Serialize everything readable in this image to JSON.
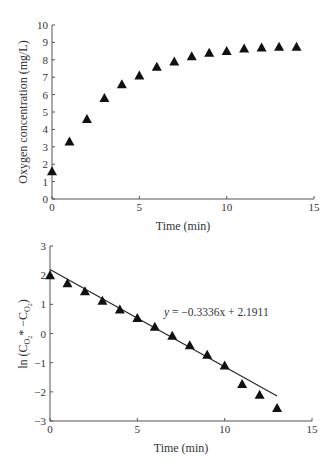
{
  "chart_data": [
    {
      "type": "scatter",
      "title": "",
      "xlabel": "Time (min)",
      "ylabel": "Oxygen concentration (mg/L)",
      "xlim": [
        0,
        15
      ],
      "ylim": [
        0,
        10
      ],
      "xticks": [
        0,
        5,
        10,
        15
      ],
      "yticks": [
        0,
        1,
        2,
        3,
        4,
        5,
        6,
        7,
        8,
        9,
        10
      ],
      "grid": false,
      "marker": "filled-triangle",
      "series": [
        {
          "name": "Oxygen concentration",
          "x": [
            0,
            1,
            2,
            3,
            4,
            5,
            6,
            7,
            8,
            9,
            10,
            11,
            12,
            13,
            14
          ],
          "y": [
            1.6,
            3.3,
            4.6,
            5.8,
            6.6,
            7.1,
            7.6,
            7.9,
            8.2,
            8.4,
            8.5,
            8.65,
            8.7,
            8.75,
            8.75
          ]
        }
      ]
    },
    {
      "type": "scatter",
      "title": "",
      "xlabel": "Time (min)",
      "ylabel": "ln (C_O2* − C_O2)",
      "xlim": [
        0,
        15
      ],
      "ylim": [
        -3,
        3
      ],
      "xticks": [
        0,
        5,
        10,
        15
      ],
      "yticks": [
        -3,
        -2,
        -1,
        0,
        1,
        2,
        3
      ],
      "grid": false,
      "marker": "filled-triangle",
      "series": [
        {
          "name": "ln(C*-C)",
          "x": [
            0,
            1,
            2,
            3,
            4,
            5,
            6,
            7,
            8,
            9,
            10,
            11,
            12,
            13
          ],
          "y": [
            2.0,
            1.72,
            1.45,
            1.12,
            0.82,
            0.53,
            0.23,
            -0.08,
            -0.4,
            -0.73,
            -1.1,
            -1.73,
            -2.1,
            -2.55
          ]
        }
      ],
      "trendline": {
        "slope": -0.3336,
        "intercept": 2.1911,
        "x_range": [
          0,
          13
        ],
        "equation_label": "y = −0.3336x + 2.1911"
      }
    }
  ],
  "labels": {
    "top": {
      "xlabel": "Time (min)",
      "ylabel": "Oxygen concentration (mg/L)",
      "xticks": [
        "0",
        "5",
        "10",
        "15"
      ],
      "yticks": [
        "0",
        "1",
        "2",
        "3",
        "4",
        "5",
        "6",
        "7",
        "8",
        "9",
        "10"
      ]
    },
    "bottom": {
      "xlabel": "Time (min)",
      "ylabel_prefix": "ln (C",
      "ylabel_sub1": "O",
      "ylabel_subsub1": "2",
      "ylabel_mid": "* −C",
      "ylabel_sub2": "O",
      "ylabel_subsub2": "2",
      "ylabel_suffix": ")",
      "xticks": [
        "0",
        "5",
        "10",
        "15"
      ],
      "yticks": [
        "3",
        "2",
        "1",
        "0",
        "−1",
        "−2",
        "−3"
      ],
      "equation_y": "y",
      "equation_rest": " = −0.3336x + 2.1911"
    }
  }
}
